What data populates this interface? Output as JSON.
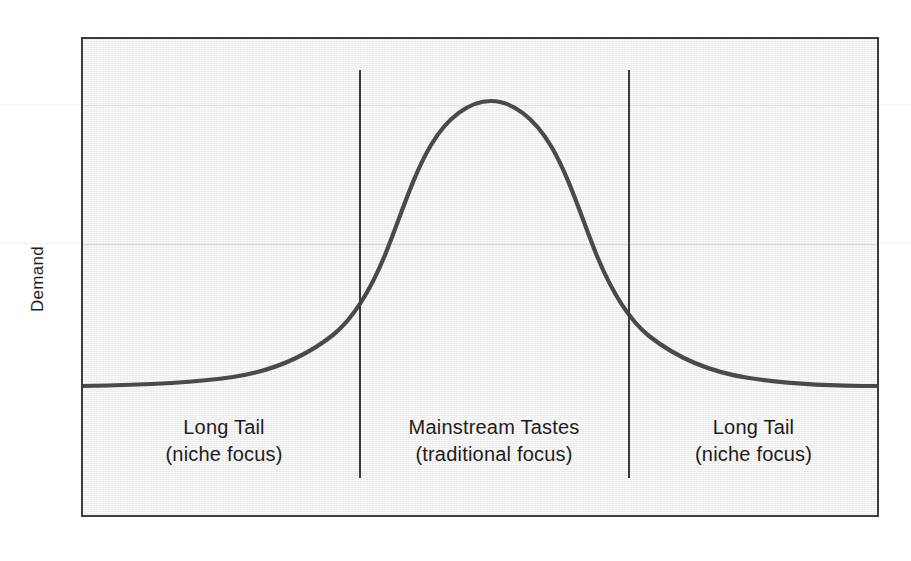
{
  "figure": {
    "background_color": "#ffffff",
    "plot_background_color": "#f0f0f0",
    "border_color": "#3c3c3c",
    "curve_color": "#4a4a4a",
    "divider_color": "#3a3a3a",
    "text_color": "#1d1d1d"
  },
  "axes": {
    "y_title": "Demand",
    "x_title": "",
    "y_tick_labels": [],
    "x_tick_labels": [],
    "grid": false
  },
  "segments": [
    {
      "id": "long-tail-left",
      "line1": "Long Tail",
      "line2": "(niche focus)"
    },
    {
      "id": "mainstream",
      "line1": "Mainstream Tastes",
      "line2": "(traditional focus)"
    },
    {
      "id": "long-tail-right",
      "line1": "Long Tail",
      "line2": "(niche focus)"
    }
  ],
  "dividers": [
    {
      "id": "divider-left",
      "x_fraction": 0.347
    },
    {
      "id": "divider-right",
      "x_fraction": 0.686
    }
  ],
  "chart_data": {
    "type": "line",
    "title": "",
    "subtitle": "",
    "xlabel": "",
    "ylabel": "Demand",
    "legend": [],
    "legend_position": "none",
    "grid": false,
    "xlim": [
      0,
      100
    ],
    "ylim": [
      0,
      100
    ],
    "annotations": [
      "Long Tail (niche focus)",
      "Mainstream Tastes (traditional focus)",
      "Long Tail (niche focus)"
    ],
    "series": [
      {
        "name": "Demand distribution",
        "shape": "gaussian",
        "peak_x": 51.5,
        "peak_y": 92,
        "baseline_y": 27,
        "sigma_x": 11.5,
        "x": [
          0,
          5,
          10,
          15,
          20,
          25,
          30,
          34.7,
          38,
          42,
          46,
          48,
          51.5,
          55,
          58,
          62,
          65,
          68.6,
          72,
          76,
          80,
          85,
          90,
          95,
          100
        ],
        "values": [
          27,
          27,
          27.5,
          28,
          29,
          31.5,
          36.5,
          43,
          52,
          66,
          81,
          87,
          92,
          90,
          83,
          68,
          56,
          44,
          36,
          31,
          29,
          28,
          27.5,
          27,
          27
        ]
      }
    ]
  }
}
